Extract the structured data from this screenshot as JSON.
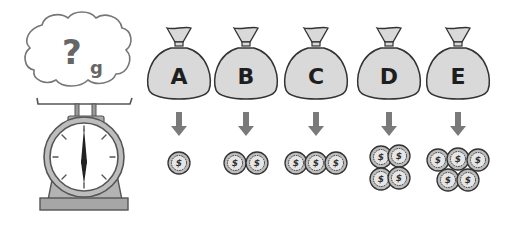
{
  "scale": {
    "thought_text": "?",
    "unit": "g",
    "colors": {
      "outline": "#555555",
      "body": "#b8b8b8",
      "face": "#ffffff",
      "needle": "#222222"
    }
  },
  "bags": [
    {
      "label": "A",
      "coins": 1
    },
    {
      "label": "B",
      "coins": 2
    },
    {
      "label": "C",
      "coins": 3
    },
    {
      "label": "D",
      "coins": 4
    },
    {
      "label": "E",
      "coins": 5
    }
  ],
  "coin_symbol": "$",
  "colors": {
    "bag_fill": "#d9d9d9",
    "bag_stroke": "#333333",
    "arrow": "#7a7a7a",
    "coin_fill": "#bdbdbd",
    "coin_stroke": "#333333"
  }
}
